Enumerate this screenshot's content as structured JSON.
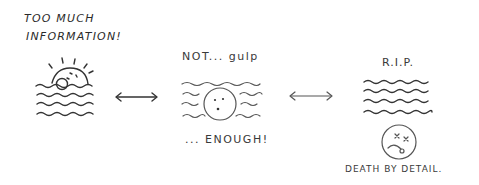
{
  "panels": {
    "left": {
      "title_line1": "TOO MUCH",
      "title_line2": "INFORMATION!",
      "icon": "sun-setting-over-waves-icon"
    },
    "middle": {
      "caption_top": "NOT... gulp",
      "caption_bottom": "... ENOUGH!",
      "icon": "face-drowning-in-waves-icon"
    },
    "right": {
      "caption_top": "R.I.P.",
      "caption_bottom": "DEATH BY DETAIL.",
      "icon": "dead-face-icon"
    }
  },
  "arrows": [
    {
      "icon": "double-arrow-icon",
      "between": "left-middle"
    },
    {
      "icon": "double-arrow-icon",
      "between": "middle-right"
    }
  ],
  "colors": {
    "ink": "#333333",
    "background": "#ffffff"
  }
}
